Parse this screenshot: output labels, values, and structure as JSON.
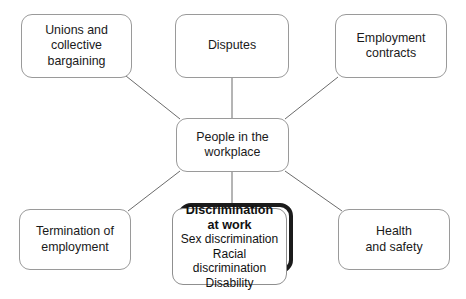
{
  "diagram": {
    "style": {
      "background": "#ffffff",
      "node_border": "#9a9a9a",
      "node_fill": "#ffffff",
      "connector": "#6b6b6b",
      "highlight_border": "#1b1b1b",
      "text": "#1a1a1a"
    },
    "center": {
      "id": "center",
      "label": "People in the\nworkplace"
    },
    "nodes": [
      {
        "id": "unions",
        "label": "Unions and\ncollective\nbargaining"
      },
      {
        "id": "disputes",
        "label": "Disputes"
      },
      {
        "id": "contracts",
        "label": "Employment\ncontracts"
      },
      {
        "id": "termination",
        "label": "Termination of\nemployment"
      },
      {
        "id": "health",
        "label": "Health\nand safety"
      }
    ],
    "highlighted": {
      "id": "discrimination",
      "heading": "Discrimination\nat work",
      "items": [
        "Sex discrimination",
        "Racial discrimination",
        "Disability"
      ]
    },
    "connectors": [
      {
        "from": "unions",
        "to": "center"
      },
      {
        "from": "disputes",
        "to": "center"
      },
      {
        "from": "contracts",
        "to": "center"
      },
      {
        "from": "termination",
        "to": "center"
      },
      {
        "from": "health",
        "to": "center"
      },
      {
        "from": "center",
        "to": "discrimination"
      }
    ]
  }
}
